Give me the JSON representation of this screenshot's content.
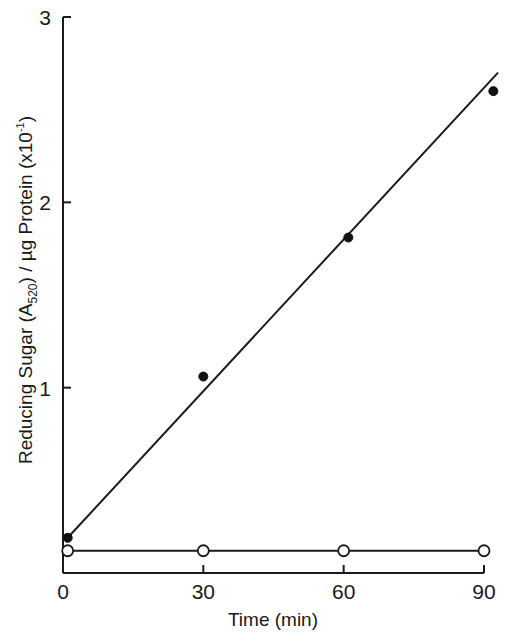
{
  "chart_data": {
    "type": "scatter",
    "title": "",
    "xlabel": "Time (min)",
    "ylabel": "Reducing Sugar (A520) / µg Protein (x10^-1)",
    "ylabel_parts": {
      "main": "Reducing Sugar (A",
      "sub": "520",
      "mid": ") / µg Protein (x10",
      "sup": "-1",
      "end": ")"
    },
    "xlim": [
      0,
      90
    ],
    "ylim": [
      0,
      3
    ],
    "x_ticks": [
      0,
      30,
      60,
      90
    ],
    "x_tick_labels": [
      "0",
      "30",
      "60",
      "90"
    ],
    "y_ticks": [
      1,
      2,
      3
    ],
    "y_tick_labels": [
      "1",
      "2",
      "3"
    ],
    "grid": false,
    "legend": null,
    "series": [
      {
        "name": "filled circles",
        "marker": "filled-circle",
        "x": [
          1,
          30,
          61,
          92
        ],
        "y": [
          0.19,
          1.06,
          1.81,
          2.6
        ],
        "fit_line": {
          "x": [
            1,
            93
          ],
          "y": [
            0.19,
            2.7
          ]
        }
      },
      {
        "name": "open circles",
        "marker": "open-circle",
        "x": [
          1,
          30,
          60,
          90
        ],
        "y": [
          0.12,
          0.12,
          0.12,
          0.12
        ],
        "connected": true
      }
    ]
  }
}
